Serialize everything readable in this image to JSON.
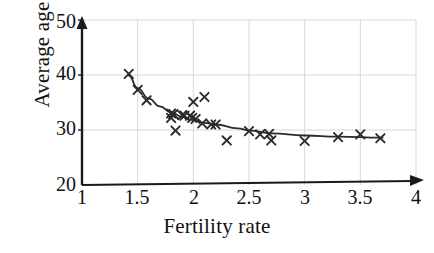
{
  "chart_data": {
    "type": "scatter",
    "title": "",
    "xlabel": "Fertility rate",
    "ylabel": "Average age",
    "xlim": [
      1,
      4
    ],
    "ylim": [
      20,
      50
    ],
    "xticks": [
      "1",
      "1.5",
      "2",
      "2.5",
      "3",
      "3.5",
      "4"
    ],
    "xtick_values": [
      1,
      1.5,
      2,
      2.5,
      3,
      3.5,
      4
    ],
    "yticks": [
      "20",
      "30",
      "40",
      "50"
    ],
    "ytick_values": [
      20,
      30,
      40,
      50
    ],
    "grid": true,
    "legend": "none",
    "marker": "x",
    "marker_color": "#2b2b2b",
    "curve_color": "#2b2b2b",
    "axis_color": "#1a1a1a",
    "grid_color": "#d8d8d8",
    "background": "#ffffff",
    "series": [
      {
        "name": "Countries",
        "type": "scatter",
        "points": [
          {
            "x": 1.42,
            "y": 40.2
          },
          {
            "x": 1.5,
            "y": 37.3
          },
          {
            "x": 1.58,
            "y": 35.4
          },
          {
            "x": 1.8,
            "y": 33.0
          },
          {
            "x": 1.8,
            "y": 32.2
          },
          {
            "x": 1.82,
            "y": 32.9
          },
          {
            "x": 1.84,
            "y": 29.9
          },
          {
            "x": 1.9,
            "y": 32.7
          },
          {
            "x": 1.92,
            "y": 32.6
          },
          {
            "x": 1.97,
            "y": 32.6
          },
          {
            "x": 1.99,
            "y": 32.2
          },
          {
            "x": 2.0,
            "y": 35.1
          },
          {
            "x": 2.02,
            "y": 32.0
          },
          {
            "x": 2.1,
            "y": 36.0
          },
          {
            "x": 2.08,
            "y": 31.2
          },
          {
            "x": 2.16,
            "y": 31.0
          },
          {
            "x": 2.2,
            "y": 31.0
          },
          {
            "x": 2.3,
            "y": 28.1
          },
          {
            "x": 2.5,
            "y": 29.8
          },
          {
            "x": 2.6,
            "y": 29.2
          },
          {
            "x": 2.68,
            "y": 29.3
          },
          {
            "x": 2.7,
            "y": 28.1
          },
          {
            "x": 3.0,
            "y": 28.0
          },
          {
            "x": 3.3,
            "y": 28.7
          },
          {
            "x": 3.5,
            "y": 29.2
          },
          {
            "x": 3.68,
            "y": 28.5
          }
        ]
      },
      {
        "name": "Fitted curve",
        "type": "line",
        "points": [
          {
            "x": 1.42,
            "y": 39.9
          },
          {
            "x": 1.5,
            "y": 37.6
          },
          {
            "x": 1.6,
            "y": 35.7
          },
          {
            "x": 1.7,
            "y": 34.3
          },
          {
            "x": 1.8,
            "y": 33.2
          },
          {
            "x": 1.9,
            "y": 32.4
          },
          {
            "x": 2.0,
            "y": 31.8
          },
          {
            "x": 2.1,
            "y": 31.3
          },
          {
            "x": 2.2,
            "y": 31.0
          },
          {
            "x": 2.4,
            "y": 30.3
          },
          {
            "x": 2.5,
            "y": 29.9
          },
          {
            "x": 2.7,
            "y": 29.4
          },
          {
            "x": 3.0,
            "y": 29.0
          },
          {
            "x": 3.3,
            "y": 28.8
          },
          {
            "x": 3.7,
            "y": 28.6
          }
        ]
      }
    ]
  },
  "axes": {
    "x_arrow": true,
    "y_arrow": true
  }
}
